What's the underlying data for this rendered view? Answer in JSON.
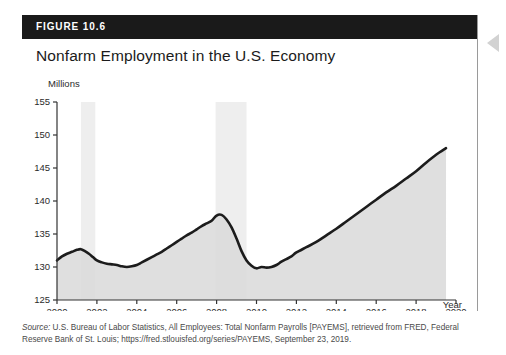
{
  "figure": {
    "label": "FIGURE 10.6",
    "title": "Nonfarm Employment in the U.S. Economy"
  },
  "source": {
    "prefix": "Source:",
    "text": " U.S. Bureau of Labor Statistics, All Employees: Total Nonfarm Payrolls [PAYEMS], retrieved from FRED, Federal Reserve Bank of St. Louis; https://fred.stlouisfed.org/series/PAYEMS, September 23, 2019."
  },
  "colors": {
    "header_bar": "#1a1a1a",
    "line": "#1c1c1c",
    "area_fill": "#d9d9d9",
    "recession_band": "#eeeeee",
    "axis": "#333333",
    "text": "#2b2b2b"
  },
  "chart_data": {
    "type": "line",
    "title": "Nonfarm Employment in the U.S. Economy",
    "xlabel": "Year",
    "ylabel": "Millions",
    "xlim": [
      2000,
      2020
    ],
    "ylim": [
      125,
      155
    ],
    "xticks": [
      2000,
      2002,
      2004,
      2006,
      2008,
      2010,
      2012,
      2014,
      2016,
      2018,
      2020
    ],
    "yticks": [
      125,
      130,
      135,
      140,
      145,
      150,
      155
    ],
    "grid": false,
    "legend": "none",
    "series": [
      {
        "name": "Total Nonfarm Payrolls (PAYEMS)",
        "x": [
          2000.0,
          2000.25,
          2000.5,
          2000.75,
          2001.0,
          2001.2,
          2001.4,
          2001.6,
          2001.8,
          2002.0,
          2002.25,
          2002.5,
          2002.75,
          2003.0,
          2003.25,
          2003.5,
          2003.75,
          2004.0,
          2004.25,
          2004.5,
          2004.75,
          2005.0,
          2005.25,
          2005.5,
          2005.75,
          2006.0,
          2006.25,
          2006.5,
          2006.75,
          2007.0,
          2007.25,
          2007.5,
          2007.75,
          2008.0,
          2008.25,
          2008.5,
          2008.75,
          2009.0,
          2009.25,
          2009.5,
          2009.75,
          2010.0,
          2010.25,
          2010.5,
          2010.75,
          2011.0,
          2011.25,
          2011.5,
          2011.75,
          2012.0,
          2012.5,
          2013.0,
          2013.5,
          2014.0,
          2014.5,
          2015.0,
          2015.5,
          2016.0,
          2016.5,
          2017.0,
          2017.5,
          2018.0,
          2018.5,
          2019.0,
          2019.5
        ],
        "y": [
          131.0,
          131.6,
          132.0,
          132.3,
          132.6,
          132.7,
          132.4,
          132.0,
          131.5,
          131.0,
          130.7,
          130.5,
          130.4,
          130.3,
          130.1,
          130.0,
          130.1,
          130.3,
          130.7,
          131.1,
          131.5,
          131.9,
          132.3,
          132.8,
          133.3,
          133.8,
          134.3,
          134.8,
          135.2,
          135.7,
          136.2,
          136.6,
          137.0,
          137.8,
          137.9,
          137.2,
          136.0,
          134.3,
          132.4,
          131.0,
          130.2,
          129.8,
          130.0,
          129.9,
          130.0,
          130.3,
          130.8,
          131.2,
          131.6,
          132.2,
          133.0,
          133.8,
          134.8,
          135.8,
          136.9,
          138.0,
          139.1,
          140.2,
          141.3,
          142.3,
          143.4,
          144.5,
          145.8,
          147.0,
          148.0
        ],
        "note": "Monthly series shown as a smooth dark line; values in millions of employees"
      }
    ],
    "shaded_regions": [
      {
        "name": "2001 recession",
        "start": 2001.2,
        "end": 2001.92
      },
      {
        "name": "Great Recession",
        "start": 2007.95,
        "end": 2009.5
      }
    ],
    "annotations": [
      {
        "label": "2008 peak",
        "x": 2008.15,
        "y": 138.4
      },
      {
        "label": "2010 trough",
        "x": 2010.1,
        "y": 129.7
      },
      {
        "label": "2019 end",
        "x": 2019.5,
        "y": 151.0
      }
    ]
  }
}
